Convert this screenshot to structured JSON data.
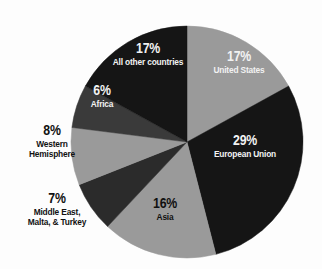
{
  "chart_data": {
    "type": "pie",
    "title": "",
    "subtitle": "",
    "xlabel": "",
    "ylabel": "",
    "legend_position": "none",
    "grid": false,
    "units": "percent",
    "total": 100,
    "categories": [
      "United States",
      "European Union",
      "Asia",
      "Middle East, Malta, & Turkey",
      "Western Hemisphere",
      "Africa",
      "All other countries"
    ],
    "values": [
      17,
      29,
      16,
      7,
      8,
      6,
      17
    ],
    "slices": [
      {
        "label": "United States",
        "label_lines": [
          "United States"
        ],
        "percent_text": "17%",
        "value": 17,
        "color": "#9a9a9a",
        "text_color": "#f2f2f2",
        "label_placement": "inside",
        "start_angle": 0,
        "end_angle": 61.2
      },
      {
        "label": "European Union",
        "label_lines": [
          "European Union"
        ],
        "percent_text": "29%",
        "value": 29,
        "color": "#151515",
        "text_color": "#f2f2f2",
        "label_placement": "inside",
        "start_angle": 61.2,
        "end_angle": 165.6
      },
      {
        "label": "Asia",
        "label_lines": [
          "Asia"
        ],
        "percent_text": "16%",
        "value": 16,
        "color": "#9a9a9a",
        "text_color": "#111111",
        "label_placement": "inside",
        "start_angle": 165.6,
        "end_angle": 223.2
      },
      {
        "label": "Middle East, Malta, & Turkey",
        "label_lines": [
          "Middle East,",
          "Malta, & Turkey"
        ],
        "percent_text": "7%",
        "value": 7,
        "color": "#2b2b2b",
        "text_color": "#111111",
        "label_placement": "outside",
        "start_angle": 223.2,
        "end_angle": 248.4
      },
      {
        "label": "Western Hemisphere",
        "label_lines": [
          "Western",
          "Hemisphere"
        ],
        "percent_text": "8%",
        "value": 8,
        "color": "#9a9a9a",
        "text_color": "#111111",
        "label_placement": "outside",
        "start_angle": 248.4,
        "end_angle": 277.2
      },
      {
        "label": "Africa",
        "label_lines": [
          "Africa"
        ],
        "percent_text": "6%",
        "value": 6,
        "color": "#3a3a3a",
        "text_color": "#f2f2f2",
        "label_placement": "inside",
        "start_angle": 277.2,
        "end_angle": 298.8
      },
      {
        "label": "All other countries",
        "label_lines": [
          "All other countries"
        ],
        "percent_text": "17%",
        "value": 17,
        "color": "#151515",
        "text_color": "#f2f2f2",
        "label_placement": "inside",
        "start_angle": 298.8,
        "end_angle": 360
      }
    ],
    "geometry": {
      "center_x": 187,
      "center_y": 142,
      "radius": 116
    },
    "background_color": "#fdfdfd"
  }
}
